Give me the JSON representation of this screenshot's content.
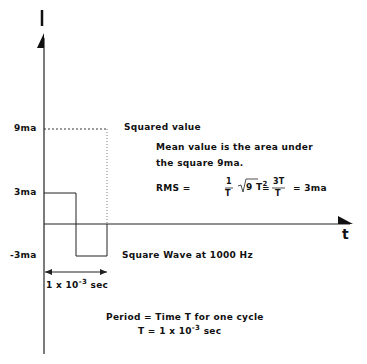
{
  "axes": {
    "y_axis_label": "I",
    "x_axis_label": "t",
    "y_ticks": [
      "9ma",
      "3ma",
      "-3ma"
    ]
  },
  "labels": {
    "squared_value": "Squared value",
    "mean_line1": "Mean value is the area under",
    "mean_line2": "the square 9ma.",
    "rms_prefix": "RMS =",
    "frac1_num": "1",
    "frac1_den": "T",
    "sqrt_body": "9  T",
    "sqrt_exp": "2",
    "eq2": "=",
    "frac2_num": "3T",
    "frac2_den": "T",
    "rms_result": "=  3ma",
    "square_wave": "Square Wave at 1000 Hz",
    "period_width_base": "1  x  10",
    "period_width_exp": "-3",
    "period_width_unit": "sec",
    "period_line1": "Period = Time T for one cycle",
    "period_line2_base": "T  =  1  x  10",
    "period_line2_exp": "-3",
    "period_line2_unit": "sec"
  }
}
